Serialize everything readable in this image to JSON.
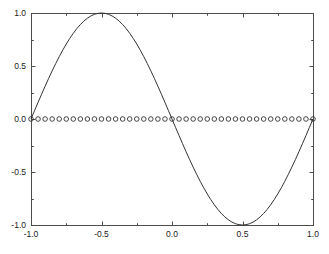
{
  "chart_data": {
    "type": "line",
    "title": "",
    "subtitle": "",
    "xlabel": "",
    "ylabel": "",
    "xlim": [
      -1.0,
      1.0
    ],
    "ylim": [
      -1.0,
      1.0
    ],
    "grid": false,
    "legend": null,
    "legend_position": "none",
    "background_color": "#ffffff",
    "axes_color": "#4d4d4d",
    "xticks": [
      -1.0,
      -0.5,
      0.0,
      0.5,
      1.0
    ],
    "xtick_labels": [
      "-1.0",
      "-0.5",
      "0.0",
      "0.5",
      "1.0"
    ],
    "xminorticks": [
      -0.75,
      -0.25,
      0.25,
      0.75
    ],
    "yticks": [
      -1.0,
      -0.5,
      0.0,
      0.5,
      1.0
    ],
    "ytick_labels": [
      "-1.0",
      "-0.5",
      "0.0",
      "0.5",
      "1.0"
    ],
    "yminorticks": [
      -0.75,
      -0.25,
      0.25,
      0.75
    ],
    "series": [
      {
        "name": "sin(pi*x)",
        "style": "solid-line",
        "marker": "none",
        "color": "#333333",
        "x": [
          -1.0,
          -0.975,
          -0.95,
          -0.925,
          -0.9,
          -0.875,
          -0.85,
          -0.825,
          -0.8,
          -0.775,
          -0.75,
          -0.725,
          -0.7,
          -0.675,
          -0.65,
          -0.625,
          -0.6,
          -0.575,
          -0.55,
          -0.525,
          -0.5,
          -0.475,
          -0.45,
          -0.425,
          -0.4,
          -0.375,
          -0.35,
          -0.325,
          -0.3,
          -0.275,
          -0.25,
          -0.225,
          -0.2,
          -0.175,
          -0.15,
          -0.125,
          -0.1,
          -0.075,
          -0.05,
          -0.025,
          0.0,
          0.025,
          0.05,
          0.075,
          0.1,
          0.125,
          0.15,
          0.175,
          0.2,
          0.225,
          0.25,
          0.275,
          0.3,
          0.325,
          0.35,
          0.375,
          0.4,
          0.425,
          0.45,
          0.475,
          0.5,
          0.525,
          0.55,
          0.575,
          0.6,
          0.625,
          0.65,
          0.675,
          0.7,
          0.725,
          0.75,
          0.775,
          0.8,
          0.825,
          0.85,
          0.875,
          0.9,
          0.925,
          0.95,
          0.975,
          1.0
        ],
        "y": [
          0.0,
          0.0785,
          0.1564,
          0.2334,
          0.309,
          0.3827,
          0.454,
          0.5225,
          0.5878,
          0.6494,
          0.7071,
          0.7604,
          0.809,
          0.8526,
          0.891,
          0.9239,
          0.9511,
          0.9724,
          0.9877,
          0.9969,
          1.0,
          0.9969,
          0.9877,
          0.9724,
          0.9511,
          0.9239,
          0.891,
          0.8526,
          0.809,
          0.7604,
          0.7071,
          0.6494,
          0.5878,
          0.5225,
          0.454,
          0.3827,
          0.309,
          0.2334,
          0.1564,
          0.0785,
          0.0,
          -0.0785,
          -0.1564,
          -0.2334,
          -0.309,
          -0.3827,
          -0.454,
          -0.5225,
          -0.5878,
          -0.6494,
          -0.7071,
          -0.7604,
          -0.809,
          -0.8526,
          -0.891,
          -0.9239,
          -0.9511,
          -0.9724,
          -0.9877,
          -0.9969,
          -1.0,
          -0.9969,
          -0.9877,
          -0.9724,
          -0.9511,
          -0.9239,
          -0.891,
          -0.8526,
          -0.809,
          -0.7604,
          -0.7071,
          -0.6494,
          -0.5878,
          -0.5225,
          -0.454,
          -0.3827,
          -0.309,
          -0.2334,
          -0.1564,
          -0.0785,
          0.0
        ]
      },
      {
        "name": "zero-level markers",
        "style": "markers-only",
        "marker": "open-circle",
        "marker_size": 4.6,
        "color": "#333333",
        "x": [
          -1.0,
          -0.95,
          -0.9,
          -0.85,
          -0.8,
          -0.75,
          -0.7,
          -0.65,
          -0.6,
          -0.55,
          -0.5,
          -0.45,
          -0.4,
          -0.35,
          -0.3,
          -0.25,
          -0.2,
          -0.15,
          -0.1,
          -0.05,
          0.0,
          0.05,
          0.1,
          0.15,
          0.2,
          0.25,
          0.3,
          0.35,
          0.4,
          0.45,
          0.5,
          0.55,
          0.6,
          0.65,
          0.7,
          0.75,
          0.8,
          0.85,
          0.9,
          0.95,
          1.0
        ],
        "y": [
          0.0,
          0.0,
          0.0,
          0.0,
          0.0,
          0.0,
          0.0,
          0.0,
          0.0,
          0.0,
          0.0,
          0.0,
          0.0,
          0.0,
          0.0,
          0.0,
          0.0,
          0.0,
          0.0,
          0.0,
          0.0,
          0.0,
          0.0,
          0.0,
          0.0,
          0.0,
          0.0,
          0.0,
          0.0,
          0.0,
          0.0,
          0.0,
          0.0,
          0.0,
          0.0,
          0.0,
          0.0,
          0.0,
          0.0,
          0.0,
          0.0
        ]
      }
    ],
    "annotations": []
  },
  "plot_box": {
    "left": 31,
    "top": 13,
    "right": 313,
    "bottom": 225
  }
}
